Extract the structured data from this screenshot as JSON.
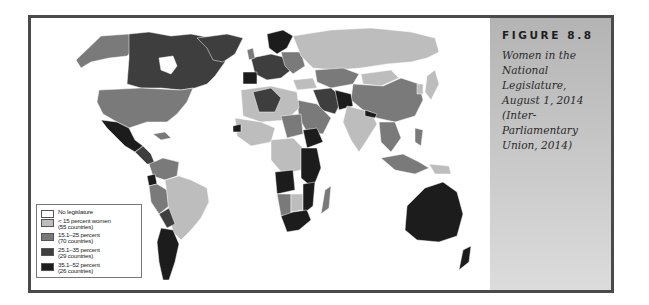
{
  "figure": {
    "label": "FIGURE 8.8",
    "caption_lines": [
      "Women in the",
      "National Legislature,",
      "August 1, 2014",
      "(Inter-Parliamentary",
      "Union, 2014)"
    ]
  },
  "legend": {
    "items": [
      {
        "label": "No legislature",
        "count": "",
        "color": "#ffffff"
      },
      {
        "label": "< 15 percent women",
        "count": "(55 countries)",
        "color": "#bdbdbd"
      },
      {
        "label": "15.1–25 percent",
        "count": "(70 countries)",
        "color": "#7a7a7a"
      },
      {
        "label": "25.1–35 percent",
        "count": "(29 countries)",
        "color": "#3e3e3e"
      },
      {
        "label": "35.1–52 percent",
        "count": "(26 countries)",
        "color": "#1c1c1c"
      }
    ]
  },
  "map": {
    "title": "Women in the National Legislature, August 1, 2014",
    "colors": {
      "none": "#ffffff",
      "lt15": "#bdbdbd",
      "p15_25": "#7a7a7a",
      "p25_35": "#3e3e3e",
      "p35_52": "#1c1c1c",
      "ocean": "#ffffff",
      "border": "#4a4a4a"
    }
  }
}
